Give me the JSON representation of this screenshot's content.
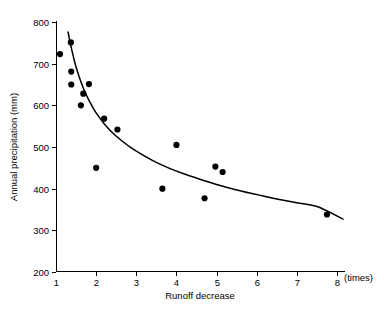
{
  "chart_data": {
    "type": "scatter",
    "title": "",
    "xlabel": "Runoff decrease",
    "ylabel": "Annual precipitation (mm)",
    "x_unit_label": "(times)",
    "xlim": [
      1,
      8
    ],
    "ylim": [
      200,
      800
    ],
    "xticks": [
      1,
      2,
      3,
      4,
      5,
      6,
      7,
      8
    ],
    "xtick_labels": [
      "1",
      "2",
      "3",
      "4",
      "5",
      "6",
      "7",
      "8"
    ],
    "yticks": [
      200,
      300,
      400,
      500,
      600,
      700,
      800
    ],
    "ytick_labels": [
      "200",
      "300",
      "400",
      "500",
      "600",
      "700",
      "800"
    ],
    "grid": false,
    "legend": null,
    "marker_color": "#000000",
    "curve_color": "#000000",
    "points": [
      {
        "x": 1.1,
        "y": 723
      },
      {
        "x": 1.37,
        "y": 751
      },
      {
        "x": 1.38,
        "y": 681
      },
      {
        "x": 1.38,
        "y": 650
      },
      {
        "x": 1.62,
        "y": 600
      },
      {
        "x": 1.68,
        "y": 628
      },
      {
        "x": 1.82,
        "y": 651
      },
      {
        "x": 2.0,
        "y": 450
      },
      {
        "x": 2.2,
        "y": 568
      },
      {
        "x": 2.53,
        "y": 542
      },
      {
        "x": 3.65,
        "y": 400
      },
      {
        "x": 4.0,
        "y": 505
      },
      {
        "x": 4.7,
        "y": 377
      },
      {
        "x": 4.97,
        "y": 453
      },
      {
        "x": 5.15,
        "y": 440
      },
      {
        "x": 7.75,
        "y": 338
      }
    ],
    "fit_curve": {
      "kind": "power-decay",
      "x_start": 1.3,
      "x_end": 8.15,
      "points": [
        {
          "x": 1.3,
          "y": 776
        },
        {
          "x": 1.35,
          "y": 752
        },
        {
          "x": 1.4,
          "y": 730
        },
        {
          "x": 1.45,
          "y": 710
        },
        {
          "x": 1.5,
          "y": 692
        },
        {
          "x": 1.6,
          "y": 662
        },
        {
          "x": 1.7,
          "y": 637
        },
        {
          "x": 1.8,
          "y": 616
        },
        {
          "x": 1.9,
          "y": 598
        },
        {
          "x": 2.0,
          "y": 582
        },
        {
          "x": 2.2,
          "y": 556
        },
        {
          "x": 2.4,
          "y": 535
        },
        {
          "x": 2.6,
          "y": 518
        },
        {
          "x": 2.8,
          "y": 503
        },
        {
          "x": 3.0,
          "y": 490
        },
        {
          "x": 3.4,
          "y": 468
        },
        {
          "x": 3.8,
          "y": 450
        },
        {
          "x": 4.2,
          "y": 435
        },
        {
          "x": 4.6,
          "y": 422
        },
        {
          "x": 5.0,
          "y": 410
        },
        {
          "x": 5.5,
          "y": 397
        },
        {
          "x": 6.0,
          "y": 386
        },
        {
          "x": 6.5,
          "y": 375
        },
        {
          "x": 7.0,
          "y": 366
        },
        {
          "x": 7.5,
          "y": 357
        },
        {
          "x": 8.15,
          "y": 327
        }
      ]
    }
  },
  "figure": {
    "background_color": "#ffffff",
    "axis_color": "#000000"
  }
}
